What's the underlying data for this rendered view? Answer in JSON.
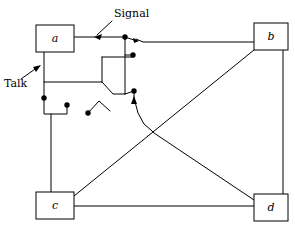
{
  "figure": {
    "background_color": "#ffffff",
    "line_color": "#000000",
    "width": 295,
    "height": 227
  },
  "nodes": [
    {
      "id": "a",
      "label": "a",
      "x": 36,
      "y": 25,
      "w": 38,
      "h": 27,
      "cx": 55,
      "cy": 38.5
    },
    {
      "id": "b",
      "label": "b",
      "x": 254,
      "y": 23,
      "w": 34,
      "h": 27,
      "cx": 271,
      "cy": 36.5
    },
    {
      "id": "c",
      "label": "c",
      "x": 36,
      "y": 192,
      "w": 38,
      "h": 27,
      "cx": 55,
      "cy": 205.5
    },
    {
      "id": "d",
      "label": "d",
      "x": 254,
      "y": 194,
      "w": 34,
      "h": 27,
      "cx": 271,
      "cy": 207.5
    }
  ],
  "annotations": [
    {
      "id": "signal",
      "label": "Signal",
      "text_x": 114,
      "text_y": 15,
      "arrow_from_x": 113,
      "arrow_from_y": 19,
      "arrow_to_x": 95,
      "arrow_to_y": 36
    },
    {
      "id": "talk",
      "label": "Talk",
      "text_x": 5,
      "text_y": 84,
      "arrow_from_x": 21,
      "arrow_from_y": 79,
      "arrow_to_x": 41,
      "arrow_to_y": 65
    }
  ],
  "contacts": [
    {
      "id": "contact-signal-a",
      "cx": 125,
      "cy": 37,
      "r": 2.6
    },
    {
      "id": "contact-signal-aux",
      "cx": 133,
      "cy": 55,
      "r": 2.6
    },
    {
      "id": "contact-talk-a",
      "cx": 44,
      "cy": 98,
      "r": 2.6
    },
    {
      "id": "contact-talk-c",
      "cx": 67,
      "cy": 105,
      "r": 2.6
    },
    {
      "id": "contact-mid-lower",
      "cx": 110,
      "cy": 111,
      "r": 2.6
    },
    {
      "id": "contact-cross-upper",
      "cx": 134,
      "cy": 91,
      "r": 2.6
    }
  ],
  "wires": {
    "a_signal_run": "M 74,37 L 125,37",
    "b_to_switch": "M 254,42 L 143,42 L 132,37",
    "a_talk_down": "M 44,52 L 44,98",
    "a_talk_right": "M 44,82 L 102,82",
    "inner_box_top": "M 102,57 L 133,57",
    "inner_box_left": "M 102,57 L 102,82",
    "inner_riser": "M 125,37 L 125,91",
    "inner_step_a": "M 102,82 L 113,94 L 125,94",
    "aux_stub": "M 125,55 L 133,55",
    "switch_blade_signal": "M 125,37 L 136,41",
    "switch_blade_lower": "M 110,111 L 99,103 L 88,113",
    "talk_lower_run": "M 44,98 L 44,114 L 67,114 L 67,105",
    "cross_stub": "M 134,91 L 134,98",
    "diag_c_to_b": "M 74,196 L 254,50",
    "diag_b_to_c_cross": "M 140,101 L 148,108",
    "diag_a_to_d": "M 134,98 L 254,200",
    "bottom_run": "M 74,206 L 254,206",
    "b_right_down": "M 283,50 L 283,194",
    "c_top_stub": "M 51,192 L 51,114"
  },
  "colors": {
    "ink": "#000000",
    "paper": "#ffffff"
  }
}
